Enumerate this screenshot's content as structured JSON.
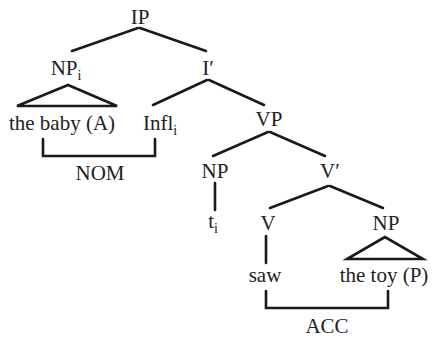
{
  "tree": {
    "root": {
      "label": "IP"
    },
    "subject_np": {
      "label": "NP",
      "subscript": "i",
      "yield": "the baby (A)"
    },
    "i_bar": {
      "label": "I′"
    },
    "infl": {
      "label": "Infl",
      "subscript": "i"
    },
    "vp": {
      "label": "VP"
    },
    "spec_np": {
      "label": "NP",
      "trace": "t",
      "trace_subscript": "i"
    },
    "v_bar": {
      "label": "V′"
    },
    "verb": {
      "label": "V",
      "yield": "saw"
    },
    "object_np": {
      "label": "NP",
      "yield": "the toy (P)"
    }
  },
  "case_brackets": {
    "nominative": {
      "label": "NOM"
    },
    "accusative": {
      "label": "ACC"
    }
  }
}
